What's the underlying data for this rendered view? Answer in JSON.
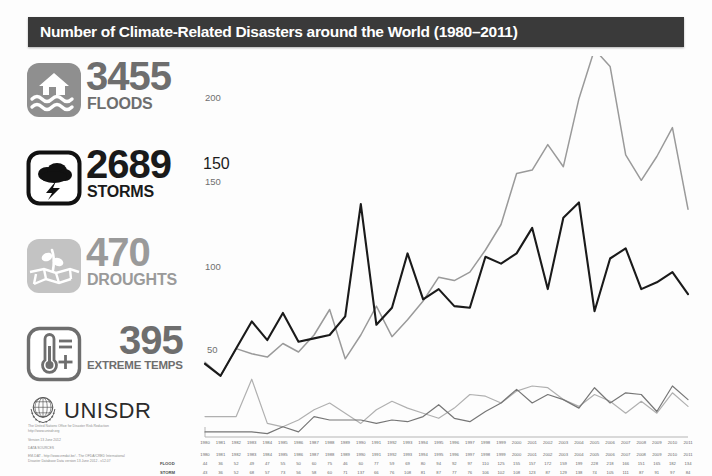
{
  "header": {
    "title": "Number of Climate-Related Disasters around the World (1980–2011)"
  },
  "stats": [
    {
      "value": "3455",
      "label": "FLOODS",
      "icon": "flood-house-icon",
      "tone": "mid"
    },
    {
      "value": "2689",
      "label": "STORMS",
      "icon": "storm-cloud-icon",
      "tone": "dark"
    },
    {
      "value": "470",
      "label": "DROUGHTS",
      "icon": "drought-plant-icon",
      "tone": "light"
    },
    {
      "value": "395",
      "label": "EXTREME TEMPS",
      "icon": "thermometer-icon",
      "tone": "mid"
    }
  ],
  "logo": {
    "wordmark": "UNISDR",
    "emblem": "un-globe-laurel-icon"
  },
  "credits": {
    "line1": "The United Nations Office for Disaster Risk Reduction",
    "line2": "http://www.unisdr.org",
    "line3": "Version 13 June 2012",
    "line4": "DATA SOURCES",
    "line5": "EM-DAT - http://www.emdat.be/ - The OFDA/CRED International",
    "line6": "Disaster Database Data version 13 June 2012 - v12.07"
  },
  "chart_data": {
    "type": "line",
    "title": "Number of Climate-Related Disasters around the World (1980–2011)",
    "xlabel": "",
    "ylabel": "",
    "ylim": [
      0,
      230
    ],
    "yticks": [
      50,
      100,
      150,
      200
    ],
    "ytick_labels": [
      "50",
      "100",
      "150",
      "200"
    ],
    "axis_overlay_label": "150",
    "grid": false,
    "legend_position": "none",
    "categories": [
      "1980",
      "1981",
      "1982",
      "1983",
      "1984",
      "1985",
      "1986",
      "1987",
      "1988",
      "1989",
      "1990",
      "1991",
      "1992",
      "1993",
      "1994",
      "1995",
      "1996",
      "1997",
      "1998",
      "1999",
      "2000",
      "2001",
      "2002",
      "2003",
      "2004",
      "2005",
      "2006",
      "2007",
      "2008",
      "2009",
      "2010",
      "2011"
    ],
    "series": [
      {
        "name": "FLOOD",
        "color": "#9a9a9a",
        "values": [
          44,
          36,
          52,
          49,
          47,
          55,
          50,
          60,
          75,
          46,
          60,
          77,
          59,
          69,
          80,
          94,
          92,
          97,
          110,
          125,
          155,
          157,
          172,
          159,
          199,
          228,
          218,
          166,
          151,
          165,
          182,
          134
        ]
      },
      {
        "name": "STORM",
        "color": "#1a1a1a",
        "values": [
          43,
          36,
          52,
          68,
          57,
          73,
          56,
          58,
          60,
          71,
          137,
          66,
          76,
          108,
          81,
          87,
          77,
          76,
          106,
          102,
          108,
          123,
          87,
          129,
          138,
          74,
          105,
          111,
          87,
          91,
          97,
          84
        ]
      },
      {
        "name": "DROUGHT",
        "color": "#b0b0b0",
        "values": [
          12,
          12,
          12,
          34,
          8,
          6,
          10,
          16,
          20,
          14,
          8,
          16,
          21,
          17,
          14,
          11,
          17,
          25,
          24,
          20,
          27,
          30,
          29,
          22,
          18,
          25,
          21,
          14,
          21,
          14,
          26,
          18
        ]
      },
      {
        "name": "EXTREME TEMPS",
        "color": "#767676",
        "values": [
          3,
          3,
          3,
          3,
          2,
          6,
          3,
          12,
          10,
          10,
          10,
          8,
          10,
          9,
          12,
          19,
          11,
          9,
          15,
          20,
          28,
          20,
          25,
          22,
          17,
          29,
          20,
          26,
          25,
          15,
          30,
          22
        ]
      }
    ]
  },
  "table": {
    "year_header": [
      "1980",
      "1981",
      "1982",
      "1983",
      "1984",
      "1985",
      "1986",
      "1987",
      "1988",
      "1989",
      "1990",
      "1991",
      "1992",
      "1993",
      "1994",
      "1995",
      "1996",
      "1997",
      "1998",
      "1999",
      "2000",
      "2001",
      "2002",
      "2003",
      "2004",
      "2005",
      "2006",
      "2007",
      "2008",
      "2009",
      "2010",
      "2011"
    ],
    "rows": [
      {
        "label": "FLOOD",
        "values": [
          "44",
          "36",
          "52",
          "49",
          "47",
          "55",
          "50",
          "60",
          "75",
          "46",
          "60",
          "77",
          "59",
          "69",
          "80",
          "94",
          "92",
          "97",
          "110",
          "125",
          "155",
          "157",
          "172",
          "159",
          "199",
          "228",
          "218",
          "166",
          "151",
          "165",
          "182",
          "134"
        ]
      },
      {
        "label": "STORM",
        "values": [
          "43",
          "36",
          "52",
          "68",
          "57",
          "73",
          "56",
          "58",
          "60",
          "71",
          "137",
          "66",
          "76",
          "108",
          "81",
          "87",
          "77",
          "76",
          "106",
          "102",
          "108",
          "123",
          "87",
          "129",
          "138",
          "74",
          "105",
          "111",
          "87",
          "91",
          "97",
          "84"
        ]
      }
    ]
  }
}
